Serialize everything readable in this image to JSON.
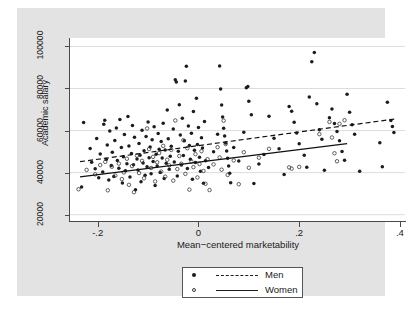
{
  "chart_data": {
    "type": "scatter",
    "title": "",
    "xlabel": "Mean−centered marketability",
    "ylabel": "Academic salary",
    "xlim": [
      -0.255,
      0.41
    ],
    "ylim": [
      17000,
      104000
    ],
    "xticks": [
      -0.2,
      0,
      0.2,
      0.4
    ],
    "xtick_labels": [
      "-.2",
      "0",
      ".2",
      ".4"
    ],
    "yticks": [
      20000,
      40000,
      60000,
      80000,
      100000
    ],
    "ytick_labels": [
      "20000",
      "40000",
      "60000",
      "80000",
      "100000"
    ],
    "grid": "horizontal",
    "legend_position": "below-axes",
    "series": [
      {
        "name": "Men",
        "marker": "filled-circle",
        "color": "#1c1c1c",
        "fit_line_style": "dashed",
        "fit_line": {
          "x0": -0.235,
          "y0": 45200,
          "x1": 0.39,
          "y1": 65500
        },
        "points": [
          [
            -0.232,
            33200
          ],
          [
            -0.228,
            63800
          ],
          [
            -0.215,
            51500
          ],
          [
            -0.212,
            44900
          ],
          [
            -0.205,
            41800
          ],
          [
            -0.202,
            56200
          ],
          [
            -0.198,
            37600
          ],
          [
            -0.195,
            48900
          ],
          [
            -0.19,
            40300
          ],
          [
            -0.188,
            63000
          ],
          [
            -0.186,
            64900
          ],
          [
            -0.183,
            46200
          ],
          [
            -0.181,
            53100
          ],
          [
            -0.178,
            36500
          ],
          [
            -0.176,
            59800
          ],
          [
            -0.173,
            43400
          ],
          [
            -0.171,
            49700
          ],
          [
            -0.168,
            38200
          ],
          [
            -0.166,
            55300
          ],
          [
            -0.163,
            61200
          ],
          [
            -0.161,
            45800
          ],
          [
            -0.158,
            42100
          ],
          [
            -0.156,
            65300
          ],
          [
            -0.153,
            51900
          ],
          [
            -0.151,
            35100
          ],
          [
            -0.149,
            47600
          ],
          [
            -0.147,
            58100
          ],
          [
            -0.145,
            40900
          ],
          [
            -0.142,
            44200
          ],
          [
            -0.14,
            66700
          ],
          [
            -0.138,
            52700
          ],
          [
            -0.136,
            37900
          ],
          [
            -0.133,
            49100
          ],
          [
            -0.131,
            62400
          ],
          [
            -0.129,
            43800
          ],
          [
            -0.127,
            56800
          ],
          [
            -0.125,
            31800
          ],
          [
            -0.122,
            46500
          ],
          [
            -0.12,
            41200
          ],
          [
            -0.118,
            53900
          ],
          [
            -0.116,
            48300
          ],
          [
            -0.114,
            35700
          ],
          [
            -0.112,
            60100
          ],
          [
            -0.11,
            44600
          ],
          [
            -0.108,
            50400
          ],
          [
            -0.106,
            38800
          ],
          [
            -0.104,
            57200
          ],
          [
            -0.102,
            42800
          ],
          [
            -0.1,
            64100
          ],
          [
            -0.098,
            47100
          ],
          [
            -0.096,
            52200
          ],
          [
            -0.094,
            39500
          ],
          [
            -0.092,
            55600
          ],
          [
            -0.09,
            45300
          ],
          [
            -0.088,
            61800
          ],
          [
            -0.086,
            33900
          ],
          [
            -0.084,
            48700
          ],
          [
            -0.082,
            43100
          ],
          [
            -0.08,
            58600
          ],
          [
            -0.078,
            51100
          ],
          [
            -0.076,
            40100
          ],
          [
            -0.074,
            54800
          ],
          [
            -0.072,
            46900
          ],
          [
            -0.07,
            63500
          ],
          [
            -0.068,
            37200
          ],
          [
            -0.066,
            50800
          ],
          [
            -0.064,
            44400
          ],
          [
            -0.062,
            69800
          ],
          [
            -0.06,
            56100
          ],
          [
            -0.058,
            41600
          ],
          [
            -0.056,
            47800
          ],
          [
            -0.054,
            52500
          ],
          [
            -0.05,
            60700
          ],
          [
            -0.048,
            45100
          ],
          [
            -0.046,
            84200
          ],
          [
            -0.044,
            83100
          ],
          [
            -0.042,
            38400
          ],
          [
            -0.04,
            50200
          ],
          [
            -0.038,
            72300
          ],
          [
            -0.036,
            57900
          ],
          [
            -0.034,
            43600
          ],
          [
            -0.032,
            65900
          ],
          [
            -0.03,
            48100
          ],
          [
            -0.028,
            55200
          ],
          [
            -0.026,
            83600
          ],
          [
            -0.024,
            90600
          ],
          [
            -0.022,
            41900
          ],
          [
            -0.02,
            62200
          ],
          [
            -0.018,
            52900
          ],
          [
            -0.016,
            46300
          ],
          [
            -0.014,
            58700
          ],
          [
            -0.012,
            36900
          ],
          [
            -0.01,
            69100
          ],
          [
            -0.008,
            50600
          ],
          [
            -0.006,
            44800
          ],
          [
            -0.004,
            75400
          ],
          [
            -0.002,
            53400
          ],
          [
            0.0,
            61400
          ],
          [
            0.002,
            47300
          ],
          [
            0.004,
            40700
          ],
          [
            0.006,
            56600
          ],
          [
            0.008,
            51700
          ],
          [
            0.01,
            34900
          ],
          [
            0.012,
            64300
          ],
          [
            0.014,
            45700
          ],
          [
            0.02,
            42400
          ],
          [
            0.03,
            49900
          ],
          [
            0.038,
            58300
          ],
          [
            0.042,
            90700
          ],
          [
            0.044,
            79800
          ],
          [
            0.046,
            72100
          ],
          [
            0.048,
            66400
          ],
          [
            0.05,
            61100
          ],
          [
            0.052,
            57400
          ],
          [
            0.054,
            54100
          ],
          [
            0.056,
            50300
          ],
          [
            0.058,
            46800
          ],
          [
            0.06,
            43200
          ],
          [
            0.062,
            39700
          ],
          [
            0.064,
            35200
          ],
          [
            0.07,
            52000
          ],
          [
            0.08,
            45500
          ],
          [
            0.09,
            59200
          ],
          [
            0.095,
            80300
          ],
          [
            0.098,
            80900
          ],
          [
            0.1,
            73900
          ],
          [
            0.105,
            67500
          ],
          [
            0.11,
            34800
          ],
          [
            0.12,
            44100
          ],
          [
            0.13,
            48600
          ],
          [
            0.14,
            66800
          ],
          [
            0.15,
            56300
          ],
          [
            0.16,
            51400
          ],
          [
            0.17,
            39100
          ],
          [
            0.18,
            71400
          ],
          [
            0.185,
            69200
          ],
          [
            0.19,
            63900
          ],
          [
            0.195,
            58800
          ],
          [
            0.2,
            53700
          ],
          [
            0.21,
            48200
          ],
          [
            0.215,
            42600
          ],
          [
            0.22,
            75900
          ],
          [
            0.225,
            92700
          ],
          [
            0.23,
            97100
          ],
          [
            0.235,
            72800
          ],
          [
            0.24,
            60400
          ],
          [
            0.245,
            55900
          ],
          [
            0.25,
            41100
          ],
          [
            0.26,
            66100
          ],
          [
            0.265,
            70300
          ],
          [
            0.27,
            63300
          ],
          [
            0.275,
            59600
          ],
          [
            0.28,
            55100
          ],
          [
            0.285,
            50100
          ],
          [
            0.29,
            45900
          ],
          [
            0.295,
            77300
          ],
          [
            0.3,
            68700
          ],
          [
            0.305,
            62800
          ],
          [
            0.31,
            58200
          ],
          [
            0.32,
            40600
          ],
          [
            0.36,
            54200
          ],
          [
            0.365,
            42800
          ],
          [
            0.375,
            73500
          ],
          [
            0.382,
            64800
          ],
          [
            0.385,
            61900
          ],
          [
            0.388,
            59100
          ]
        ]
      },
      {
        "name": "Women",
        "marker": "open-circle",
        "color": "#3a3a3a",
        "fit_line_style": "solid",
        "fit_line": {
          "x0": -0.235,
          "y0": 38000,
          "x1": 0.295,
          "y1": 53800
        },
        "points": [
          [
            -0.238,
            32100
          ],
          [
            -0.222,
            41300
          ],
          [
            -0.205,
            39200
          ],
          [
            -0.195,
            43600
          ],
          [
            -0.185,
            45100
          ],
          [
            -0.18,
            31600
          ],
          [
            -0.172,
            42800
          ],
          [
            -0.165,
            38600
          ],
          [
            -0.158,
            44300
          ],
          [
            -0.152,
            36900
          ],
          [
            -0.148,
            40100
          ],
          [
            -0.142,
            46600
          ],
          [
            -0.138,
            34200
          ],
          [
            -0.132,
            43100
          ],
          [
            -0.128,
            30700
          ],
          [
            -0.122,
            48100
          ],
          [
            -0.118,
            39800
          ],
          [
            -0.112,
            45600
          ],
          [
            -0.108,
            37300
          ],
          [
            -0.102,
            61000
          ],
          [
            -0.098,
            51200
          ],
          [
            -0.094,
            42200
          ],
          [
            -0.09,
            47500
          ],
          [
            -0.086,
            35800
          ],
          [
            -0.082,
            44900
          ],
          [
            -0.078,
            49300
          ],
          [
            -0.074,
            40500
          ],
          [
            -0.07,
            52700
          ],
          [
            -0.066,
            38100
          ],
          [
            -0.062,
            46100
          ],
          [
            -0.058,
            43500
          ],
          [
            -0.054,
            50800
          ],
          [
            -0.05,
            36200
          ],
          [
            -0.046,
            64800
          ],
          [
            -0.042,
            41700
          ],
          [
            -0.038,
            47900
          ],
          [
            -0.034,
            44200
          ],
          [
            -0.03,
            55400
          ],
          [
            -0.026,
            39400
          ],
          [
            -0.022,
            51600
          ],
          [
            -0.018,
            31900
          ],
          [
            -0.014,
            45300
          ],
          [
            -0.01,
            42600
          ],
          [
            -0.006,
            48800
          ],
          [
            -0.002,
            37700
          ],
          [
            0.002,
            44100
          ],
          [
            0.006,
            50200
          ],
          [
            0.01,
            40800
          ],
          [
            0.014,
            34700
          ],
          [
            0.018,
            46400
          ],
          [
            0.022,
            31700
          ],
          [
            0.03,
            43900
          ],
          [
            0.038,
            52100
          ],
          [
            0.042,
            47200
          ],
          [
            0.046,
            41400
          ],
          [
            0.05,
            64700
          ],
          [
            0.054,
            53600
          ],
          [
            0.058,
            38900
          ],
          [
            0.07,
            45800
          ],
          [
            0.08,
            34500
          ],
          [
            0.09,
            49700
          ],
          [
            0.1,
            42300
          ],
          [
            0.12,
            47100
          ],
          [
            0.14,
            51300
          ],
          [
            0.18,
            42500
          ],
          [
            0.185,
            41900
          ],
          [
            0.2,
            42700
          ],
          [
            0.24,
            58300
          ],
          [
            0.26,
            64100
          ],
          [
            0.265,
            56700
          ],
          [
            0.27,
            49200
          ],
          [
            0.275,
            45400
          ],
          [
            0.28,
            63200
          ],
          [
            0.29,
            64900
          ]
        ]
      }
    ]
  },
  "legend": {
    "entries": [
      {
        "label": "Men",
        "marker": "filled-circle",
        "line": "dashed"
      },
      {
        "label": "Women",
        "marker": "open-circle",
        "line": "solid"
      }
    ]
  }
}
